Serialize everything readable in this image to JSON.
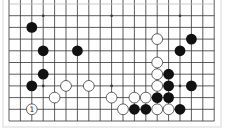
{
  "board": {
    "cols": 19,
    "rows": 11,
    "origin_x": 9,
    "origin_y": 4,
    "spacing_x": 11.4,
    "spacing_y": 11.7,
    "stone_radius": 5.4,
    "colors": {
      "line": "#333333",
      "frame": "#d8d8d8",
      "black": "#111111",
      "white_fill": "#ffffff",
      "white_edge": "#222222",
      "background": "#ffffff"
    },
    "star_points": [
      [
        3,
        1
      ],
      [
        9,
        1
      ],
      [
        15,
        1
      ],
      [
        3,
        7
      ],
      [
        9,
        7
      ],
      [
        15,
        7
      ]
    ],
    "stones": [
      {
        "c": 2,
        "r": 2,
        "color": "black"
      },
      {
        "c": 3,
        "r": 4,
        "color": "black"
      },
      {
        "c": 6,
        "r": 4,
        "color": "black"
      },
      {
        "c": 3,
        "r": 6,
        "color": "black"
      },
      {
        "c": 2,
        "r": 7,
        "color": "black"
      },
      {
        "c": 5,
        "r": 7,
        "color": "white"
      },
      {
        "c": 7,
        "r": 7,
        "color": "white"
      },
      {
        "c": 4,
        "r": 8,
        "color": "white"
      },
      {
        "c": 9,
        "r": 8,
        "color": "white"
      },
      {
        "c": 2,
        "r": 9,
        "color": "white",
        "label": "1"
      },
      {
        "c": 13,
        "r": 3,
        "color": "white"
      },
      {
        "c": 16,
        "r": 3,
        "color": "black"
      },
      {
        "c": 15,
        "r": 4,
        "color": "black"
      },
      {
        "c": 13,
        "r": 5,
        "color": "white"
      },
      {
        "c": 13,
        "r": 6,
        "color": "white"
      },
      {
        "c": 14,
        "r": 6,
        "color": "black"
      },
      {
        "c": 13,
        "r": 7,
        "color": "white"
      },
      {
        "c": 14,
        "r": 7,
        "color": "black"
      },
      {
        "c": 16,
        "r": 7,
        "color": "black"
      },
      {
        "c": 11,
        "r": 8,
        "color": "white"
      },
      {
        "c": 12,
        "r": 8,
        "color": "white"
      },
      {
        "c": 13,
        "r": 8,
        "color": "black"
      },
      {
        "c": 14,
        "r": 8,
        "color": "black"
      },
      {
        "c": 10,
        "r": 9,
        "color": "white"
      },
      {
        "c": 11,
        "r": 9,
        "color": "black"
      },
      {
        "c": 12,
        "r": 9,
        "color": "black"
      },
      {
        "c": 13,
        "r": 9,
        "color": "white"
      },
      {
        "c": 14,
        "r": 9,
        "color": "white"
      },
      {
        "c": 15,
        "r": 9,
        "color": "black"
      }
    ]
  }
}
